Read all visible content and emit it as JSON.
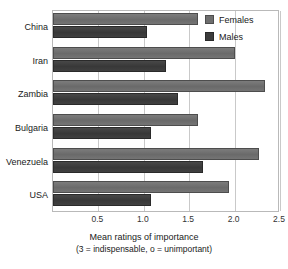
{
  "chart_data": {
    "type": "bar",
    "orientation": "horizontal",
    "title": "",
    "xlabel": "Mean ratings of importance",
    "xlabel_sub": "(3 = indispensable, o = unimportant)",
    "ylabel": "",
    "categories": [
      "China",
      "Iran",
      "Zambia",
      "Bulgaria",
      "Venezuela",
      "USA"
    ],
    "series": [
      {
        "name": "Females",
        "color": "#6e6e6e",
        "values": [
          1.6,
          2.0,
          2.34,
          1.6,
          2.27,
          1.94
        ]
      },
      {
        "name": "Males",
        "color": "#3c3c3c",
        "values": [
          1.03,
          1.24,
          1.38,
          1.08,
          1.65,
          1.08
        ]
      }
    ],
    "xlim": [
      0,
      2.5
    ],
    "xticks": [
      0.5,
      1.0,
      1.5,
      2.0,
      2.5
    ],
    "xtick_labels": [
      "0.5",
      "1.0",
      "1.5",
      "2.0",
      "2.5"
    ],
    "grid": true,
    "grid_axis": "x",
    "legend_position": "top-right"
  },
  "legend": {
    "items": [
      {
        "label": "Females",
        "swatch": "females"
      },
      {
        "label": "Males",
        "swatch": "males"
      }
    ]
  }
}
